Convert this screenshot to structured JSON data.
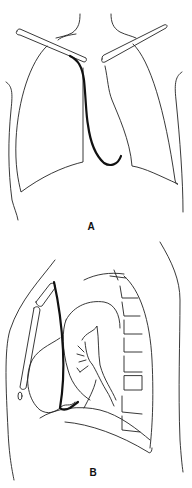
{
  "figure": {
    "panels": [
      {
        "id": "A",
        "label": "A",
        "view": "frontal"
      },
      {
        "id": "B",
        "label": "B",
        "view": "lateral"
      }
    ],
    "colors": {
      "line": "#222222",
      "catheter": "#111111",
      "background": "#ffffff"
    }
  }
}
